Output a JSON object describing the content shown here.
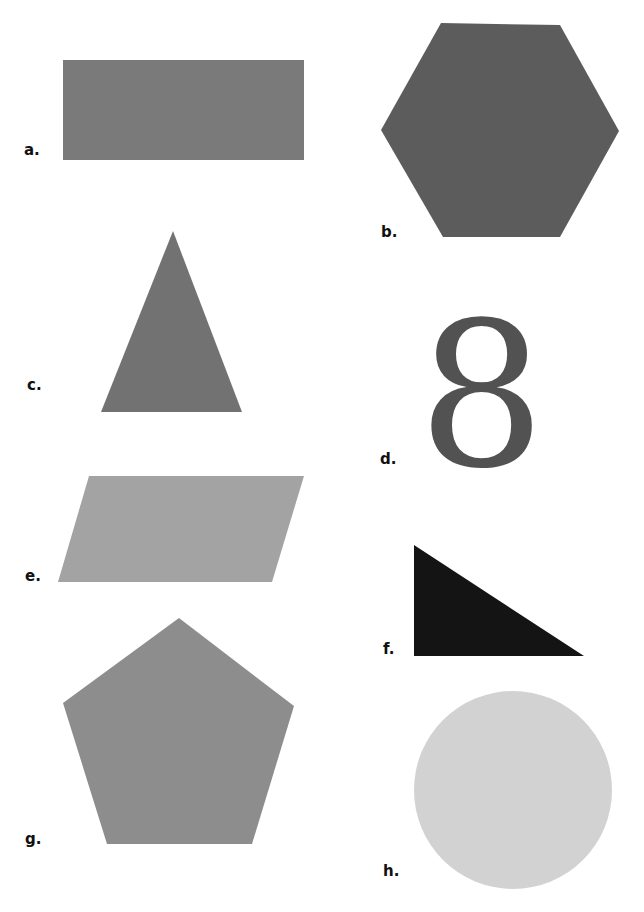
{
  "shapes": [
    {
      "id": "a",
      "label": "a.",
      "shape": "rectangle",
      "color": "#7a7a7a"
    },
    {
      "id": "b",
      "label": "b.",
      "shape": "hexagon",
      "color": "#5c5c5c"
    },
    {
      "id": "c",
      "label": "c.",
      "shape": "triangle",
      "color": "#727272"
    },
    {
      "id": "d",
      "label": "d.",
      "shape": "numeral",
      "glyph": "8",
      "color": "#525252"
    },
    {
      "id": "e",
      "label": "e.",
      "shape": "parallelogram",
      "color": "#a3a3a3"
    },
    {
      "id": "f",
      "label": "f.",
      "shape": "right-triangle",
      "color": "#141414"
    },
    {
      "id": "g",
      "label": "g.",
      "shape": "pentagon",
      "color": "#8d8d8d"
    },
    {
      "id": "h",
      "label": "h.",
      "shape": "circle",
      "color": "#d2d2d2"
    }
  ]
}
